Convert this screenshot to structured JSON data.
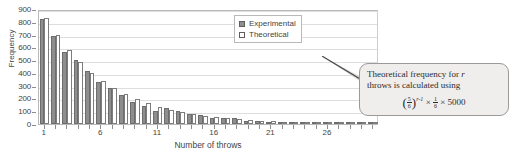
{
  "chart_data": {
    "type": "bar",
    "title": "",
    "xlabel": "Number of throws",
    "ylabel": "Frequency",
    "ylim": [
      0,
      900
    ],
    "ytick_step": 100,
    "yticks": [
      0,
      100,
      200,
      300,
      400,
      500,
      600,
      700,
      800,
      900
    ],
    "xticks": [
      1,
      6,
      11,
      16,
      21,
      26
    ],
    "xlim": [
      0.5,
      30.5
    ],
    "grid": true,
    "legend_position": "top-right",
    "categories": [
      1,
      2,
      3,
      4,
      5,
      6,
      7,
      8,
      9,
      10,
      11,
      12,
      13,
      14,
      15,
      16,
      17,
      18,
      19,
      20,
      21,
      22,
      23,
      24,
      25,
      26,
      27,
      28,
      29,
      30
    ],
    "series": [
      {
        "name": "Experimental",
        "color": "#8e8e8e",
        "values": [
          820,
          690,
          562,
          503,
          412,
          325,
          284,
          225,
          172,
          143,
          100,
          124,
          103,
          77,
          72,
          50,
          44,
          48,
          20,
          20,
          12,
          10,
          9,
          7,
          6,
          5,
          4,
          3,
          3,
          2
        ]
      },
      {
        "name": "Theoretical",
        "color": "#ffffff",
        "values": [
          833,
          694,
          579,
          482,
          402,
          335,
          279,
          233,
          194,
          162,
          135,
          112,
          94,
          78,
          65,
          54,
          45,
          38,
          31,
          26,
          22,
          18,
          15,
          12,
          10,
          9,
          7,
          6,
          5,
          4
        ]
      }
    ]
  },
  "legend": {
    "items": [
      {
        "label": "Experimental",
        "swatch": "filled"
      },
      {
        "label": "Theoretical",
        "swatch": "empty"
      }
    ]
  },
  "callout": {
    "line1_a": "Theoretical frequency for ",
    "line1_b": "r",
    "line2": "throws is calculated using",
    "formula_plain": "(5/6)^(r-1) × 1/6 × 5000",
    "formula_parts": {
      "base_num": "5",
      "base_den": "6",
      "exponent": "r-1",
      "times1": "×",
      "second_num": "1",
      "second_den": "6",
      "times2": "×",
      "multiplier": "5000"
    }
  },
  "axes": {
    "y_title": "Frequency",
    "x_title": "Number of throws"
  }
}
